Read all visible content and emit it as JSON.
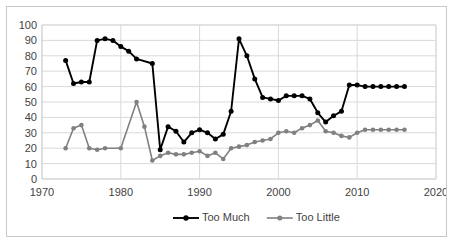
{
  "chart_data": {
    "type": "line",
    "title": "",
    "xlabel": "",
    "ylabel": "",
    "xlim": [
      1970,
      2020
    ],
    "ylim": [
      0,
      100
    ],
    "xticks": [
      1970,
      1980,
      1990,
      2000,
      2010,
      2020
    ],
    "yticks": [
      0,
      10,
      20,
      30,
      40,
      50,
      60,
      70,
      80,
      90,
      100
    ],
    "grid": true,
    "legend_position": "bottom",
    "series": [
      {
        "name": "Too Much",
        "color": "#000000",
        "x": [
          1973,
          1974,
          1975,
          1976,
          1977,
          1978,
          1979,
          1980,
          1981,
          1982,
          1984,
          1985,
          1986,
          1987,
          1988,
          1989,
          1990,
          1991,
          1992,
          1993,
          1994,
          1995,
          1996,
          1997,
          1998,
          1999,
          2000,
          2001,
          2002,
          2003,
          2004,
          2005,
          2006,
          2007,
          2008,
          2009,
          2010,
          2011,
          2012,
          2013,
          2014,
          2015,
          2016
        ],
        "values": [
          77,
          62,
          63,
          63,
          90,
          91,
          90,
          86,
          83,
          78,
          75,
          19,
          34,
          31,
          24,
          30,
          32,
          30,
          26,
          29,
          44,
          91,
          80,
          65,
          53,
          52,
          51,
          54,
          54,
          54,
          52,
          43,
          37,
          41,
          44,
          61,
          61,
          60,
          60,
          60,
          60,
          60,
          60
        ]
      },
      {
        "name": "Too Little",
        "color": "#808080",
        "x": [
          1973,
          1974,
          1975,
          1976,
          1977,
          1978,
          1980,
          1982,
          1983,
          1984,
          1985,
          1986,
          1987,
          1988,
          1989,
          1990,
          1991,
          1992,
          1993,
          1994,
          1995,
          1996,
          1997,
          1998,
          1999,
          2000,
          2001,
          2002,
          2003,
          2004,
          2005,
          2006,
          2007,
          2008,
          2009,
          2010,
          2011,
          2012,
          2013,
          2014,
          2015,
          2016
        ],
        "values": [
          20,
          33,
          35,
          20,
          19,
          20,
          20,
          50,
          34,
          12,
          15,
          17,
          16,
          16,
          17,
          18,
          15,
          17,
          13,
          20,
          21,
          22,
          24,
          25,
          26,
          30,
          31,
          30,
          33,
          35,
          38,
          31,
          30,
          28,
          27,
          30,
          32,
          32,
          32,
          32,
          32,
          32
        ]
      }
    ]
  },
  "legend": [
    {
      "label": "Too Much",
      "color": "#000000"
    },
    {
      "label": "Too Little",
      "color": "#808080"
    }
  ]
}
